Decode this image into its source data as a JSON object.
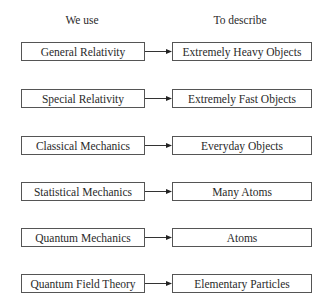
{
  "headers": {
    "left": "We use",
    "right": "To describe"
  },
  "rows": [
    {
      "theory": "General Relativity",
      "domain": "Extremely Heavy Objects",
      "top": 42
    },
    {
      "theory": "Special Relativity",
      "domain": "Extremely Fast Objects",
      "top": 89
    },
    {
      "theory": "Classical Mechanics",
      "domain": "Everyday Objects",
      "top": 136
    },
    {
      "theory": "Statistical Mechanics",
      "domain": "Many Atoms",
      "top": 182
    },
    {
      "theory": "Quantum Mechanics",
      "domain": "Atoms",
      "top": 228
    },
    {
      "theory": "Quantum Field Theory",
      "domain": "Elementary Particles",
      "top": 274
    }
  ]
}
